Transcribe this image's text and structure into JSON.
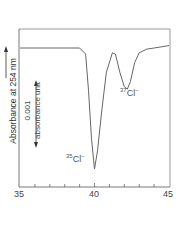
{
  "chart_data": {
    "type": "line",
    "title": "",
    "xlabel": "",
    "ylabel": "Absorbance at 254 nm",
    "x_ticks": [
      "35",
      "40",
      "45"
    ],
    "xlim": [
      35,
      45
    ],
    "grid": false,
    "legend": null,
    "scale_bar": {
      "value": "0.001",
      "unit": "absorbance unit"
    },
    "annotations": [
      {
        "text": "35Cl-",
        "x": 40.0,
        "note": "major negative peak"
      },
      {
        "text": "37Cl-",
        "x": 42.2,
        "note": "minor negative peak"
      }
    ],
    "series": [
      {
        "name": "absorbance trace",
        "x": [
          35.0,
          36.0,
          37.0,
          38.0,
          39.0,
          39.4,
          39.6,
          39.8,
          40.0,
          40.2,
          40.5,
          40.8,
          41.2,
          41.4,
          41.7,
          42.0,
          42.2,
          42.4,
          42.7,
          43.0,
          43.5,
          44.0,
          45.0
        ],
        "y_relative": [
          0.0,
          0.0,
          0.0,
          0.0,
          0.0,
          -0.05,
          -0.35,
          -0.75,
          -1.0,
          -0.85,
          -0.5,
          -0.2,
          -0.04,
          -0.05,
          -0.2,
          -0.32,
          -0.34,
          -0.28,
          -0.12,
          -0.04,
          -0.01,
          0.0,
          0.02
        ]
      }
    ]
  },
  "labels": {
    "ylabel": "Absorbance at 254 nm",
    "scale_value": "0.001",
    "scale_unit": "absorbance unit",
    "peak1_mass": "35",
    "peak1_ion": "Cl",
    "peak1_charge": "−",
    "peak2_mass": "37",
    "peak2_ion": "Cl",
    "peak2_charge": "−",
    "x_tick_0": "35",
    "x_tick_1": "40",
    "x_tick_2": "45"
  }
}
